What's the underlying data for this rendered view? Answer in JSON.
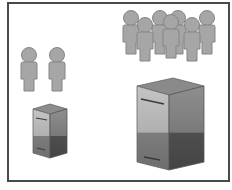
{
  "diagram": {
    "title": "",
    "groups": [
      {
        "name": "small-group",
        "people_count": 2,
        "server_size": "small"
      },
      {
        "name": "large-group",
        "people_count": 7,
        "server_size": "large"
      }
    ],
    "colors": {
      "person_fill": "#a6a6a6",
      "person_stroke": "#808080",
      "server_top": "#8a8a8a",
      "server_front_light": "#bdbdbd",
      "server_front_dark": "#7a7a7a",
      "server_side": "#5e5e5e",
      "frame_border": "#4a4a4a"
    }
  }
}
